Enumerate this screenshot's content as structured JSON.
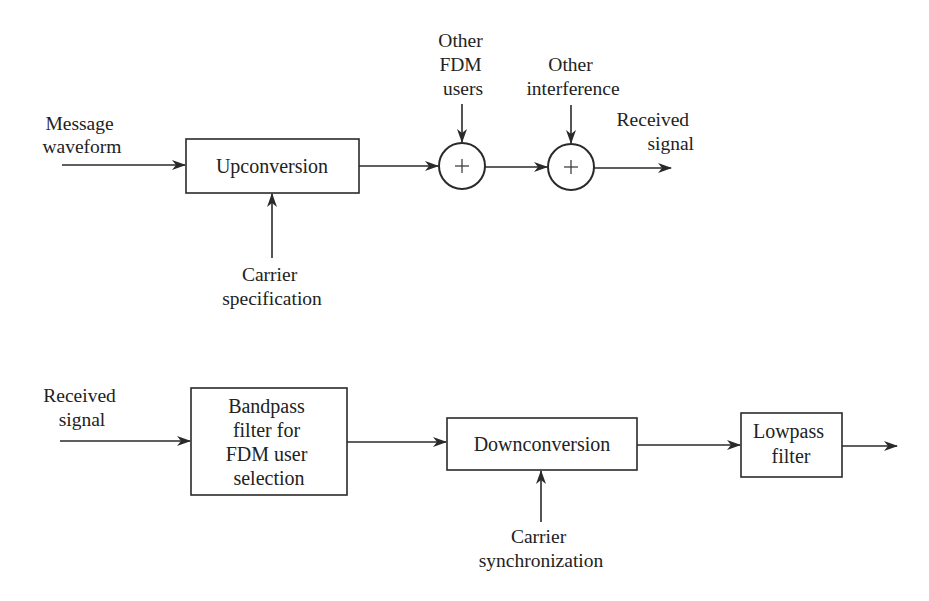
{
  "transmitter": {
    "input_label": [
      "Message",
      "waveform"
    ],
    "upconversion_block": "Upconversion",
    "carrier_label": [
      "Carrier",
      "specification"
    ],
    "adder1_symbol": "+",
    "adder1_input_label": [
      "Other",
      "FDM",
      "users"
    ],
    "adder2_symbol": "+",
    "adder2_input_label": [
      "Other",
      "interference"
    ],
    "output_label": [
      "Received",
      "signal"
    ]
  },
  "receiver": {
    "input_label": [
      "Received",
      "signal"
    ],
    "bandpass_block": [
      "Bandpass",
      "filter for",
      "FDM user",
      "selection"
    ],
    "downconversion_block": "Downconversion",
    "carrier_label": [
      "Carrier",
      "synchronization"
    ],
    "lowpass_block": [
      "Lowpass",
      "filter"
    ]
  },
  "colors": {
    "line": "#2a2a2a",
    "text": "#222222",
    "background": "#ffffff"
  }
}
